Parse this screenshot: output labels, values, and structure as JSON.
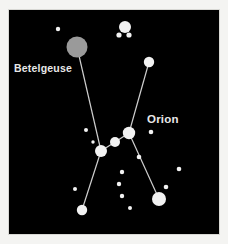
{
  "figure": {
    "kind": "star-chart",
    "background_color": "#f4f4f2",
    "sky_color": "#000000",
    "frame_color": "#d8d8d4",
    "line_color": "#cfcfcf",
    "star_color": "#f2f2f2",
    "betelgeuse_color": "#9a9a9a",
    "label_color": "#e8e8e8"
  },
  "labels": [
    {
      "id": "betelgeuse",
      "text": "Betelgeuse"
    },
    {
      "id": "orion",
      "text": "Orion"
    }
  ],
  "chart_data": {
    "type": "scatter",
    "title": "Orion",
    "xlabel": "",
    "ylabel": "",
    "xlim": [
      0,
      210
    ],
    "ylim": [
      0,
      224
    ],
    "grid": false,
    "legend": "none",
    "annotations": [
      "Betelgeuse",
      "Orion"
    ],
    "stars": [
      {
        "name": "betelgeuse",
        "x": 68,
        "y": 37,
        "r": 10.5,
        "color": "#9a9a9a"
      },
      {
        "name": "bright-top",
        "x": 116,
        "y": 17,
        "r": 6.0,
        "color": "#f2f2f2"
      },
      {
        "name": "small-top-a",
        "x": 110,
        "y": 25,
        "r": 2.6,
        "color": "#f2f2f2"
      },
      {
        "name": "small-top-b",
        "x": 120,
        "y": 25,
        "r": 2.6,
        "color": "#f2f2f2"
      },
      {
        "name": "small-upper-left",
        "x": 49,
        "y": 19,
        "r": 2.2,
        "color": "#f2f2f2"
      },
      {
        "name": "bellatrix",
        "x": 140,
        "y": 52,
        "r": 5.2,
        "color": "#f2f2f2"
      },
      {
        "name": "belt-left",
        "x": 92,
        "y": 141,
        "r": 6.0,
        "color": "#f2f2f2"
      },
      {
        "name": "belt-middle",
        "x": 106,
        "y": 132,
        "r": 5.0,
        "color": "#f2f2f2"
      },
      {
        "name": "belt-right",
        "x": 120,
        "y": 123,
        "r": 6.2,
        "color": "#f2f2f2"
      },
      {
        "name": "rigel",
        "x": 73,
        "y": 200,
        "r": 5.2,
        "color": "#f2f2f2"
      },
      {
        "name": "saiph",
        "x": 150,
        "y": 189,
        "r": 7.0,
        "color": "#f2f2f2"
      },
      {
        "name": "field-a",
        "x": 77,
        "y": 120,
        "r": 2.0,
        "color": "#f2f2f2"
      },
      {
        "name": "field-b",
        "x": 84,
        "y": 132,
        "r": 1.7,
        "color": "#f2f2f2"
      },
      {
        "name": "sword-a",
        "x": 113,
        "y": 162,
        "r": 2.2,
        "color": "#f2f2f2"
      },
      {
        "name": "sword-b",
        "x": 110,
        "y": 174,
        "r": 2.2,
        "color": "#f2f2f2"
      },
      {
        "name": "sword-c",
        "x": 113,
        "y": 186,
        "r": 2.2,
        "color": "#f2f2f2"
      },
      {
        "name": "field-right-a",
        "x": 142,
        "y": 122,
        "r": 2.3,
        "color": "#f2f2f2"
      },
      {
        "name": "field-right-b",
        "x": 130,
        "y": 147,
        "r": 2.3,
        "color": "#f2f2f2"
      },
      {
        "name": "field-right-c",
        "x": 170,
        "y": 159,
        "r": 2.3,
        "color": "#f2f2f2"
      },
      {
        "name": "field-right-d",
        "x": 157,
        "y": 177,
        "r": 2.3,
        "color": "#f2f2f2"
      },
      {
        "name": "field-lower-left",
        "x": 66,
        "y": 179,
        "r": 2.0,
        "color": "#f2f2f2"
      },
      {
        "name": "field-lower-mid",
        "x": 121,
        "y": 198,
        "r": 2.0,
        "color": "#f2f2f2"
      }
    ],
    "lines": [
      {
        "name": "betelgeuse-to-rigel",
        "from": "betelgeuse",
        "to": "rigel",
        "via": [
          "belt-left"
        ]
      },
      {
        "name": "bellatrix-to-saiph",
        "from": "bellatrix",
        "to": "saiph",
        "via": [
          "belt-right"
        ]
      },
      {
        "name": "belt",
        "from": "belt-left",
        "to": "belt-right",
        "via": [
          "belt-middle"
        ]
      }
    ]
  }
}
